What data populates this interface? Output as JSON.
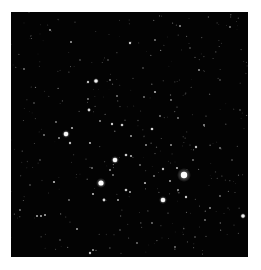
{
  "image": {
    "description": "Open star cluster against black sky",
    "background_color": "#030303",
    "border_color": "#ffffff",
    "frame": {
      "x": 11,
      "y": 12,
      "width": 237,
      "height": 245
    }
  },
  "stars": [
    {
      "x": 184,
      "y": 175,
      "r": 3.2,
      "b": 1.0,
      "glow": 7
    },
    {
      "x": 101,
      "y": 183,
      "r": 2.6,
      "b": 1.0,
      "glow": 5
    },
    {
      "x": 115,
      "y": 160,
      "r": 2.3,
      "b": 0.95,
      "glow": 4
    },
    {
      "x": 163,
      "y": 200,
      "r": 2.3,
      "b": 0.95,
      "glow": 4
    },
    {
      "x": 66,
      "y": 134,
      "r": 2.3,
      "b": 0.95,
      "glow": 4
    },
    {
      "x": 96,
      "y": 81,
      "r": 1.8,
      "b": 0.9,
      "glow": 3
    },
    {
      "x": 243,
      "y": 216,
      "r": 1.8,
      "b": 0.9,
      "glow": 3
    },
    {
      "x": 89,
      "y": 110,
      "r": 1.4,
      "b": 0.85,
      "glow": 2
    },
    {
      "x": 122,
      "y": 125,
      "r": 1.3,
      "b": 0.8,
      "glow": 2
    },
    {
      "x": 112,
      "y": 124,
      "r": 1.2,
      "b": 0.8,
      "glow": 2
    },
    {
      "x": 88,
      "y": 82,
      "r": 1.2,
      "b": 0.75,
      "glow": 2
    },
    {
      "x": 130,
      "y": 43,
      "r": 1.2,
      "b": 0.8,
      "glow": 2
    },
    {
      "x": 155,
      "y": 92,
      "r": 1.1,
      "b": 0.7,
      "glow": 2
    },
    {
      "x": 152,
      "y": 129,
      "r": 1.3,
      "b": 0.85,
      "glow": 2
    },
    {
      "x": 196,
      "y": 147,
      "r": 1.2,
      "b": 0.75,
      "glow": 2
    },
    {
      "x": 72,
      "y": 128,
      "r": 1.1,
      "b": 0.7,
      "glow": 2
    },
    {
      "x": 70,
      "y": 143,
      "r": 1.2,
      "b": 0.75,
      "glow": 2
    },
    {
      "x": 126,
      "y": 155,
      "r": 1.3,
      "b": 0.8,
      "glow": 2
    },
    {
      "x": 131,
      "y": 156,
      "r": 1.1,
      "b": 0.7,
      "glow": 2
    },
    {
      "x": 90,
      "y": 143,
      "r": 1.1,
      "b": 0.7,
      "glow": 2
    },
    {
      "x": 177,
      "y": 168,
      "r": 1.1,
      "b": 0.7,
      "glow": 2
    },
    {
      "x": 163,
      "y": 169,
      "r": 1.2,
      "b": 0.75,
      "glow": 2
    },
    {
      "x": 170,
      "y": 181,
      "r": 1.0,
      "b": 0.7,
      "glow": 2
    },
    {
      "x": 145,
      "y": 183,
      "r": 1.1,
      "b": 0.7,
      "glow": 2
    },
    {
      "x": 126,
      "y": 190,
      "r": 1.3,
      "b": 0.8,
      "glow": 2
    },
    {
      "x": 130,
      "y": 192,
      "r": 1.0,
      "b": 0.7,
      "glow": 2
    },
    {
      "x": 93,
      "y": 194,
      "r": 1.1,
      "b": 0.75,
      "glow": 2
    },
    {
      "x": 104,
      "y": 200,
      "r": 1.4,
      "b": 0.85,
      "glow": 2
    },
    {
      "x": 118,
      "y": 200,
      "r": 1.0,
      "b": 0.7,
      "glow": 2
    },
    {
      "x": 186,
      "y": 197,
      "r": 1.2,
      "b": 0.8,
      "glow": 2
    },
    {
      "x": 178,
      "y": 190,
      "r": 1.0,
      "b": 0.65,
      "glow": 2
    },
    {
      "x": 54,
      "y": 182,
      "r": 1.1,
      "b": 0.75,
      "glow": 2
    },
    {
      "x": 37,
      "y": 216,
      "r": 1.0,
      "b": 0.7,
      "glow": 2
    },
    {
      "x": 41,
      "y": 216,
      "r": 1.0,
      "b": 0.7,
      "glow": 2
    },
    {
      "x": 45,
      "y": 215,
      "r": 1.0,
      "b": 0.7,
      "glow": 2
    },
    {
      "x": 90,
      "y": 253,
      "r": 1.2,
      "b": 0.75,
      "glow": 2
    },
    {
      "x": 93,
      "y": 250,
      "r": 1.0,
      "b": 0.65,
      "glow": 2
    },
    {
      "x": 77,
      "y": 229,
      "r": 1.0,
      "b": 0.65,
      "glow": 2
    },
    {
      "x": 210,
      "y": 208,
      "r": 1.0,
      "b": 0.6,
      "glow": 2
    },
    {
      "x": 50,
      "y": 30,
      "r": 1.0,
      "b": 0.6,
      "glow": 2
    },
    {
      "x": 71,
      "y": 42,
      "r": 1.0,
      "b": 0.65,
      "glow": 2
    },
    {
      "x": 155,
      "y": 40,
      "r": 0.9,
      "b": 0.55,
      "glow": 2
    },
    {
      "x": 180,
      "y": 26,
      "r": 1.0,
      "b": 0.6,
      "glow": 2
    },
    {
      "x": 230,
      "y": 27,
      "r": 0.9,
      "b": 0.55,
      "glow": 2
    },
    {
      "x": 199,
      "y": 70,
      "r": 1.0,
      "b": 0.6,
      "glow": 2
    },
    {
      "x": 131,
      "y": 136,
      "r": 1.0,
      "b": 0.65,
      "glow": 2
    },
    {
      "x": 117,
      "y": 96,
      "r": 0.9,
      "b": 0.55,
      "glow": 2
    },
    {
      "x": 100,
      "y": 121,
      "r": 1.0,
      "b": 0.6,
      "glow": 2
    },
    {
      "x": 146,
      "y": 145,
      "r": 1.0,
      "b": 0.6,
      "glow": 2
    },
    {
      "x": 171,
      "y": 145,
      "r": 1.0,
      "b": 0.6,
      "glow": 2
    },
    {
      "x": 204,
      "y": 125,
      "r": 1.0,
      "b": 0.6,
      "glow": 2
    },
    {
      "x": 220,
      "y": 148,
      "r": 0.9,
      "b": 0.55,
      "glow": 2
    },
    {
      "x": 59,
      "y": 138,
      "r": 1.0,
      "b": 0.6,
      "glow": 2
    },
    {
      "x": 44,
      "y": 135,
      "r": 0.9,
      "b": 0.55,
      "glow": 2
    },
    {
      "x": 56,
      "y": 122,
      "r": 0.9,
      "b": 0.55,
      "glow": 2
    },
    {
      "x": 88,
      "y": 99,
      "r": 0.9,
      "b": 0.55,
      "glow": 2
    },
    {
      "x": 110,
      "y": 80,
      "r": 0.9,
      "b": 0.55,
      "glow": 2
    },
    {
      "x": 144,
      "y": 97,
      "r": 0.9,
      "b": 0.5,
      "glow": 2
    },
    {
      "x": 171,
      "y": 100,
      "r": 0.9,
      "b": 0.55,
      "glow": 2
    },
    {
      "x": 178,
      "y": 118,
      "r": 0.9,
      "b": 0.55,
      "glow": 2
    },
    {
      "x": 160,
      "y": 116,
      "r": 0.9,
      "b": 0.55,
      "glow": 2
    },
    {
      "x": 193,
      "y": 160,
      "r": 0.9,
      "b": 0.5,
      "glow": 2
    },
    {
      "x": 110,
      "y": 170,
      "r": 1.0,
      "b": 0.6,
      "glow": 2
    },
    {
      "x": 113,
      "y": 175,
      "r": 0.9,
      "b": 0.55,
      "glow": 2
    },
    {
      "x": 140,
      "y": 165,
      "r": 0.9,
      "b": 0.5,
      "glow": 2
    },
    {
      "x": 154,
      "y": 176,
      "r": 0.9,
      "b": 0.55,
      "glow": 2
    },
    {
      "x": 69,
      "y": 200,
      "r": 0.9,
      "b": 0.5,
      "glow": 2
    },
    {
      "x": 92,
      "y": 168,
      "r": 0.9,
      "b": 0.5,
      "glow": 2
    },
    {
      "x": 152,
      "y": 223,
      "r": 0.9,
      "b": 0.5,
      "glow": 2
    },
    {
      "x": 205,
      "y": 220,
      "r": 0.9,
      "b": 0.5,
      "glow": 2
    },
    {
      "x": 220,
      "y": 196,
      "r": 0.9,
      "b": 0.5,
      "glow": 2
    },
    {
      "x": 137,
      "y": 243,
      "r": 0.9,
      "b": 0.5,
      "glow": 2
    },
    {
      "x": 175,
      "y": 247,
      "r": 0.9,
      "b": 0.5,
      "glow": 2
    },
    {
      "x": 20,
      "y": 210,
      "r": 0.9,
      "b": 0.5,
      "glow": 2
    },
    {
      "x": 24,
      "y": 69,
      "r": 0.9,
      "b": 0.5,
      "glow": 2
    },
    {
      "x": 34,
      "y": 103,
      "r": 0.8,
      "b": 0.45,
      "glow": 2
    },
    {
      "x": 220,
      "y": 80,
      "r": 0.8,
      "b": 0.45,
      "glow": 2
    },
    {
      "x": 240,
      "y": 110,
      "r": 0.8,
      "b": 0.45,
      "glow": 2
    },
    {
      "x": 232,
      "y": 160,
      "r": 0.8,
      "b": 0.45,
      "glow": 2
    },
    {
      "x": 60,
      "y": 240,
      "r": 0.8,
      "b": 0.45,
      "glow": 2
    },
    {
      "x": 120,
      "y": 230,
      "r": 0.8,
      "b": 0.45,
      "glow": 2
    },
    {
      "x": 195,
      "y": 237,
      "r": 0.8,
      "b": 0.45,
      "glow": 2
    },
    {
      "x": 108,
      "y": 60,
      "r": 0.8,
      "b": 0.45,
      "glow": 2
    },
    {
      "x": 143,
      "y": 68,
      "r": 0.8,
      "b": 0.45,
      "glow": 2
    },
    {
      "x": 190,
      "y": 48,
      "r": 0.8,
      "b": 0.45,
      "glow": 2
    },
    {
      "x": 80,
      "y": 60,
      "r": 0.8,
      "b": 0.45,
      "glow": 2
    },
    {
      "x": 40,
      "y": 160,
      "r": 0.8,
      "b": 0.45,
      "glow": 2
    },
    {
      "x": 30,
      "y": 185,
      "r": 0.8,
      "b": 0.45,
      "glow": 2
    }
  ],
  "faint_field": {
    "count": 320,
    "seed": 7,
    "min_r": 0.35,
    "max_r": 0.7,
    "min_b": 0.15,
    "max_b": 0.45
  }
}
